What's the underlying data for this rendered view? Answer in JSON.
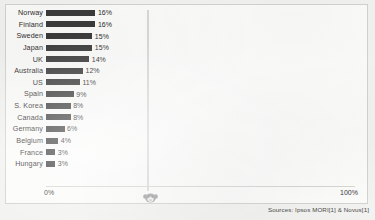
{
  "chart_data": {
    "type": "bar",
    "orientation": "horizontal",
    "title": "",
    "xlabel": "",
    "ylabel": "",
    "xlim": [
      0,
      100
    ],
    "grid": false,
    "legend": null,
    "axis_ticks": [
      "0%",
      "100%"
    ],
    "value_suffix": "%",
    "categories": [
      "Norway",
      "Finland",
      "Sweden",
      "Japan",
      "UK",
      "Australia",
      "US",
      "Spain",
      "S. Korea",
      "Canada",
      "Germany",
      "Belgium",
      "France",
      "Hungary"
    ],
    "values": [
      16,
      16,
      15,
      15,
      14,
      12,
      11,
      9,
      8,
      8,
      6,
      4,
      3,
      3
    ],
    "value_labels": [
      "16%",
      "16%",
      "15%",
      "15%",
      "14%",
      "12%",
      "11%",
      "9%",
      "8%",
      "8%",
      "6%",
      "4%",
      "3%",
      "3%"
    ],
    "bar_color": "#3b3b3b",
    "source": "Sources: Ipsos MORI[1] & Novus[1]"
  },
  "axis": {
    "zero_label": "0%",
    "max_label": "100%"
  },
  "footer": {
    "source": "Sources: Ipsos MORI[1] & Novus[1]"
  },
  "watermark": {
    "name": "circular-logo-watermark"
  }
}
